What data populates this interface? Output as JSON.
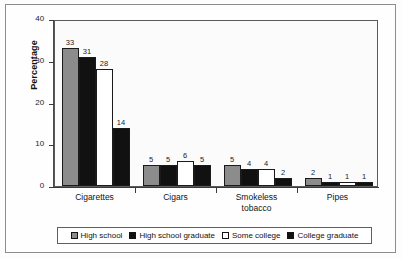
{
  "chart_data": {
    "type": "bar",
    "title": "",
    "subtitle": "",
    "xlabel": "",
    "ylabel": "Percentage",
    "ylim": [
      0,
      40
    ],
    "yticks": [
      0,
      10,
      20,
      30,
      40
    ],
    "ytick_labels": [
      "0",
      "10",
      "20",
      "30",
      "40"
    ],
    "grid": false,
    "legend_position": "bottom",
    "categories": [
      "Cigarettes",
      "Cigars",
      "Smokeless\ntobacco",
      "Pipes"
    ],
    "series": [
      {
        "name": "High school",
        "color": "#8c8c8c",
        "values": [
          33,
          5,
          5,
          2
        ]
      },
      {
        "name": "High school graduate",
        "color": "#111111",
        "values": [
          31,
          5,
          4,
          1
        ]
      },
      {
        "name": "Some college",
        "color": "#ffffff",
        "values": [
          28,
          6,
          4,
          1
        ]
      },
      {
        "name": "College graduate",
        "color": "#111111",
        "values": [
          14,
          5,
          2,
          1
        ]
      }
    ]
  },
  "legend": {
    "items": [
      {
        "label": "High school"
      },
      {
        "label": "High school graduate"
      },
      {
        "label": "Some college"
      },
      {
        "label": "College graduate"
      }
    ]
  }
}
